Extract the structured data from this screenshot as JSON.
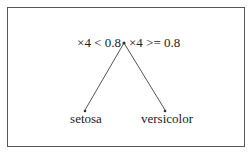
{
  "diagram": {
    "type": "decision-tree",
    "root": {
      "left_split_label": "×4 < 0.8",
      "right_split_label": "×4 >= 0.8"
    },
    "leaves": [
      {
        "label": "setosa"
      },
      {
        "label": "versicolor"
      }
    ],
    "colors": {
      "edge": "#555555",
      "text": "#222222",
      "border": "#555555"
    }
  }
}
